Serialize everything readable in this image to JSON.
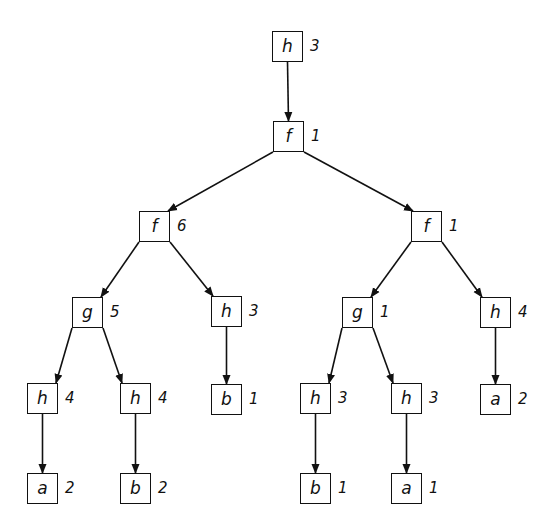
{
  "diagram": {
    "type": "tree",
    "box_size": 31,
    "stroke_color": "#111111",
    "background": "#ffffff",
    "nodes": [
      {
        "id": "n0",
        "label": "h",
        "count": "3",
        "x": 272,
        "y": 31,
        "parent": null
      },
      {
        "id": "n1",
        "label": "f",
        "count": "1",
        "x": 273,
        "y": 121,
        "parent": "n0"
      },
      {
        "id": "n2",
        "label": "f",
        "count": "6",
        "x": 139,
        "y": 211,
        "parent": "n1"
      },
      {
        "id": "n3",
        "label": "f",
        "count": "1",
        "x": 411,
        "y": 211,
        "parent": "n1"
      },
      {
        "id": "n4",
        "label": "g",
        "count": "5",
        "x": 72,
        "y": 297,
        "parent": "n2"
      },
      {
        "id": "n5",
        "label": "h",
        "count": "3",
        "x": 211,
        "y": 296,
        "parent": "n2"
      },
      {
        "id": "n6",
        "label": "g",
        "count": "1",
        "x": 342,
        "y": 297,
        "parent": "n3"
      },
      {
        "id": "n7",
        "label": "h",
        "count": "4",
        "x": 480,
        "y": 297,
        "parent": "n3"
      },
      {
        "id": "n8",
        "label": "h",
        "count": "4",
        "x": 27,
        "y": 383,
        "parent": "n4"
      },
      {
        "id": "n9",
        "label": "h",
        "count": "4",
        "x": 120,
        "y": 383,
        "parent": "n4"
      },
      {
        "id": "n10",
        "label": "b",
        "count": "1",
        "x": 211,
        "y": 384,
        "parent": "n5"
      },
      {
        "id": "n11",
        "label": "h",
        "count": "3",
        "x": 300,
        "y": 383,
        "parent": "n6"
      },
      {
        "id": "n12",
        "label": "h",
        "count": "3",
        "x": 391,
        "y": 383,
        "parent": "n6"
      },
      {
        "id": "n13",
        "label": "a",
        "count": "2",
        "x": 480,
        "y": 384,
        "parent": "n7"
      },
      {
        "id": "n14",
        "label": "a",
        "count": "2",
        "x": 27,
        "y": 473,
        "parent": "n8"
      },
      {
        "id": "n15",
        "label": "b",
        "count": "2",
        "x": 120,
        "y": 473,
        "parent": "n9"
      },
      {
        "id": "n16",
        "label": "b",
        "count": "1",
        "x": 300,
        "y": 473,
        "parent": "n11"
      },
      {
        "id": "n17",
        "label": "a",
        "count": "1",
        "x": 391,
        "y": 473,
        "parent": "n12"
      }
    ]
  }
}
